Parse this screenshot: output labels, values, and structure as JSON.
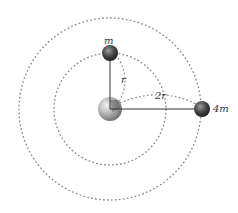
{
  "diagram": {
    "title": "",
    "center_body": {
      "name": "planet",
      "cx": 110,
      "cy": 109,
      "r": 12
    },
    "orbits": [
      {
        "name": "inner-orbit",
        "radius": 56,
        "label": "r"
      },
      {
        "name": "outer-orbit",
        "radius": 91,
        "label": "2r"
      }
    ],
    "satellites": [
      {
        "name": "satellite-m",
        "label": "m",
        "cx": 110,
        "cy": 53,
        "r": 8
      },
      {
        "name": "satellite-4m",
        "label": "4m",
        "cx": 202,
        "cy": 109,
        "r": 8
      }
    ],
    "labels": {
      "m": "m",
      "four_m": "4m",
      "r": "r",
      "two_r": "2r"
    },
    "colors": {
      "orbit": "#8a8a8a",
      "line": "#333333",
      "satellite": "#3a3a3a",
      "planet": "#a8a8a8"
    }
  }
}
